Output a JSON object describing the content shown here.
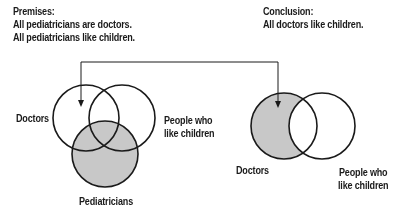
{
  "premises": {
    "heading": "Premises:",
    "lines": [
      "All pediatricians are doctors.",
      "All pediatricians like children."
    ]
  },
  "conclusion": {
    "heading": "Conclusion:",
    "line": "All doctors like children."
  },
  "left_diagram": {
    "labels": {
      "doctors": "Doctors",
      "people_line1": "People who",
      "people_line2": "like children",
      "pediatricians": "Pediatricians"
    },
    "shaded_region": "Pediatricians outside Doctors and outside People who like children"
  },
  "right_diagram": {
    "labels": {
      "doctors": "Doctors",
      "people_line1": "People who",
      "people_line2": "like children"
    },
    "shaded_region": "Doctors outside People who like children"
  },
  "colors": {
    "stroke": "#1a1a1a",
    "shade": "#c8c8c8",
    "background": "#ffffff"
  }
}
